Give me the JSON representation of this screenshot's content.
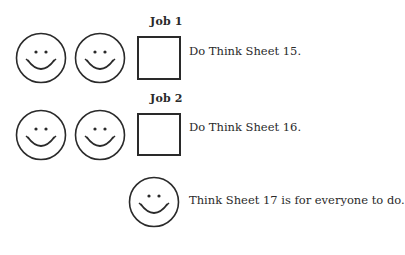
{
  "jobs": [
    {
      "label": "Job 1",
      "smiley_count": 2,
      "instruction": "Do Think Sheet 15."
    },
    {
      "label": "Job 2",
      "smiley_count": 2,
      "instruction": "Do Think Sheet 16."
    }
  ],
  "everyone": {
    "smiley_count": 1,
    "instruction": "Think Sheet 17 is for everyone to do."
  },
  "icons": {
    "smiley": "smiley-face-icon",
    "checkbox": "empty-checkbox"
  },
  "colors": {
    "ink": "#2a2a2a",
    "background": "#ffffff"
  }
}
